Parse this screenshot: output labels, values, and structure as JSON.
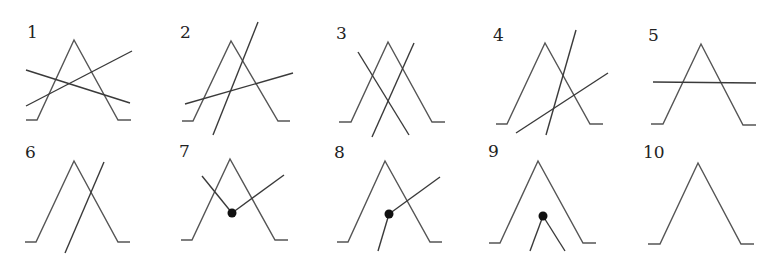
{
  "figure": {
    "width": 782,
    "height": 261,
    "colors": {
      "stroke": "#555555",
      "line": "#3a3a3a",
      "dot": "#111111",
      "label": "#222222"
    },
    "panels": [
      {
        "id": "1",
        "label": "1",
        "label_pos": [
          27,
          38
        ],
        "tent": [
          [
            26,
            120
          ],
          [
            37,
            120
          ],
          [
            74,
            40
          ],
          [
            118,
            120
          ],
          [
            131,
            120
          ]
        ],
        "lines": [
          [
            [
              26,
              70
            ],
            [
              130,
              103
            ]
          ],
          [
            [
              26,
              106
            ],
            [
              132,
              51
            ]
          ]
        ],
        "dots": []
      },
      {
        "id": "2",
        "label": "2",
        "label_pos": [
          180,
          38
        ],
        "tent": [
          [
            182,
            121
          ],
          [
            193,
            121
          ],
          [
            231,
            41
          ],
          [
            278,
            121
          ],
          [
            290,
            121
          ]
        ],
        "lines": [
          [
            [
              213,
              135
            ],
            [
              258,
              22
            ]
          ],
          [
            [
              185,
              104
            ],
            [
              293,
              73
            ]
          ]
        ],
        "dots": []
      },
      {
        "id": "3",
        "label": "3",
        "label_pos": [
          336,
          39
        ],
        "tent": [
          [
            339,
            122
          ],
          [
            351,
            122
          ],
          [
            388,
            42
          ],
          [
            432,
            122
          ],
          [
            445,
            122
          ]
        ],
        "lines": [
          [
            [
              358,
              52
            ],
            [
              409,
              135
            ]
          ],
          [
            [
              414,
              43
            ],
            [
              372,
              137
            ]
          ]
        ],
        "dots": []
      },
      {
        "id": "4",
        "label": "4",
        "label_pos": [
          493,
          41
        ],
        "tent": [
          [
            496,
            124
          ],
          [
            507,
            124
          ],
          [
            545,
            43
          ],
          [
            590,
            124
          ],
          [
            603,
            124
          ]
        ],
        "lines": [
          [
            [
              546,
              135
            ],
            [
              576,
              30
            ]
          ],
          [
            [
              516,
              133
            ],
            [
              608,
              73
            ]
          ]
        ],
        "dots": []
      },
      {
        "id": "5",
        "label": "5",
        "label_pos": [
          648,
          41
        ],
        "tent": [
          [
            651,
            124
          ],
          [
            663,
            124
          ],
          [
            701,
            44
          ],
          [
            743,
            125
          ],
          [
            756,
            125
          ]
        ],
        "lines": [
          [
            [
              653,
              82
            ],
            [
              756,
              83
            ]
          ]
        ],
        "dots": []
      },
      {
        "id": "6",
        "label": "6",
        "label_pos": [
          25,
          158
        ],
        "tent": [
          [
            25,
            242
          ],
          [
            36,
            242
          ],
          [
            74,
            161
          ],
          [
            118,
            242
          ],
          [
            130,
            242
          ]
        ],
        "lines": [
          [
            [
              65,
              253
            ],
            [
              104,
              162
            ]
          ]
        ],
        "dots": []
      },
      {
        "id": "7",
        "label": "7",
        "label_pos": [
          179,
          157
        ],
        "tent": [
          [
            181,
            240
          ],
          [
            192,
            240
          ],
          [
            230,
            159
          ],
          [
            275,
            240
          ],
          [
            288,
            240
          ]
        ],
        "lines": [
          [
            [
              202,
              176
            ],
            [
              232,
              213
            ]
          ],
          [
            [
              232,
              213
            ],
            [
              284,
              175
            ]
          ]
        ],
        "dots": [
          [
            232,
            213
          ]
        ]
      },
      {
        "id": "8",
        "label": "8",
        "label_pos": [
          334,
          158
        ],
        "tent": [
          [
            337,
            242
          ],
          [
            348,
            242
          ],
          [
            385,
            161
          ],
          [
            430,
            242
          ],
          [
            442,
            242
          ]
        ],
        "lines": [
          [
            [
              389,
              214
            ],
            [
              440,
              177
            ]
          ],
          [
            [
              389,
              214
            ],
            [
              378,
              251
            ]
          ]
        ],
        "dots": [
          [
            389,
            214
          ]
        ]
      },
      {
        "id": "9",
        "label": "9",
        "label_pos": [
          488,
          157
        ],
        "tent": [
          [
            489,
            243
          ],
          [
            500,
            243
          ],
          [
            538,
            161
          ],
          [
            583,
            243
          ],
          [
            596,
            243
          ]
        ],
        "lines": [
          [
            [
              543,
              216
            ],
            [
              530,
              251
            ]
          ],
          [
            [
              543,
              216
            ],
            [
              565,
              251
            ]
          ]
        ],
        "dots": [
          [
            543,
            216
          ]
        ]
      },
      {
        "id": "10",
        "label": "10",
        "label_pos": [
          643,
          158
        ],
        "tent": [
          [
            648,
            244
          ],
          [
            660,
            244
          ],
          [
            698,
            163
          ],
          [
            741,
            244
          ],
          [
            754,
            244
          ]
        ],
        "lines": [],
        "dots": []
      }
    ]
  }
}
